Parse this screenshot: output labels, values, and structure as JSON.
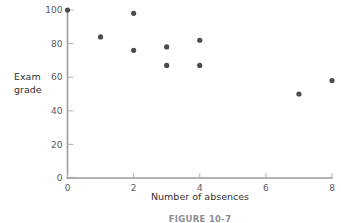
{
  "figure": {
    "caption": "FIGURE 10-7"
  },
  "chart_data": {
    "type": "scatter",
    "title": "",
    "xlabel": "Number of absences",
    "ylabel_line1": "Exam",
    "ylabel_line2": "grade",
    "ylabel": "Exam grade",
    "xlim": [
      0,
      8
    ],
    "ylim": [
      0,
      100
    ],
    "xticks": [
      0,
      2,
      4,
      6,
      8
    ],
    "yticks": [
      0,
      20,
      40,
      60,
      80,
      100
    ],
    "xtick_labels": [
      "0",
      "2",
      "4",
      "6",
      "8"
    ],
    "ytick_labels": [
      "0",
      "20",
      "40",
      "60",
      "80",
      "100"
    ],
    "grid": false,
    "legend": false,
    "marker_color": "#4c4c4e",
    "axis_color": "#9a9a9a",
    "points": [
      {
        "x": 0,
        "y": 100
      },
      {
        "x": 1,
        "y": 84
      },
      {
        "x": 2,
        "y": 98
      },
      {
        "x": 2,
        "y": 76
      },
      {
        "x": 3,
        "y": 78
      },
      {
        "x": 3,
        "y": 67
      },
      {
        "x": 4,
        "y": 82
      },
      {
        "x": 4,
        "y": 67
      },
      {
        "x": 7,
        "y": 50
      },
      {
        "x": 8,
        "y": 58
      }
    ]
  }
}
